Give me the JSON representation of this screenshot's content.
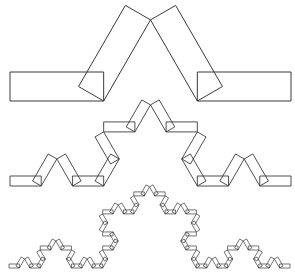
{
  "diagram": {
    "title": "",
    "width": 295,
    "height": 279,
    "stroke_color": "#3a3a3a",
    "background": "#ffffff",
    "levels": [
      {
        "name": "level-1",
        "iteration": 1,
        "x_start": 10,
        "x_end": 291,
        "baseline_y": 101,
        "strip_width": 29,
        "stroke_width": 1.0
      },
      {
        "name": "level-2",
        "iteration": 2,
        "x_start": 10,
        "x_end": 291,
        "baseline_y": 186,
        "strip_width": 10,
        "stroke_width": 0.9
      },
      {
        "name": "level-3",
        "iteration": 3,
        "x_start": 9,
        "x_end": 290,
        "baseline_y": 268,
        "strip_width": 4,
        "stroke_width": 0.7
      }
    ]
  }
}
